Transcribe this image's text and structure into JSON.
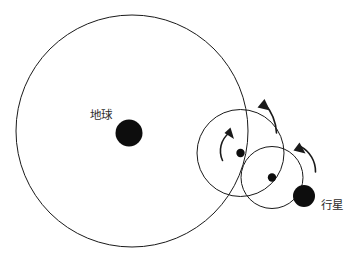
{
  "diagram": {
    "type": "ptolemaic-epicycle-diagram",
    "title": "",
    "background_color": "#ffffff",
    "stroke_color": "#1a1a1a",
    "label_color": "#2b2b2b",
    "canvas": {
      "width": 355,
      "height": 258
    },
    "labels": {
      "earth": "地球",
      "planet": "行星"
    },
    "label_positions": {
      "earth": {
        "x": 90,
        "y": 115
      },
      "planet": {
        "x": 321,
        "y": 205
      }
    },
    "circles": [
      {
        "name": "deferent",
        "cx": 132,
        "cy": 131,
        "r": 116,
        "stroke_width": 1,
        "filled": false
      },
      {
        "name": "epicycle-primary",
        "cx": 240.5,
        "cy": 153,
        "r": 43.5,
        "stroke_width": 1,
        "filled": false
      },
      {
        "name": "epicycle-secondary",
        "cx": 272,
        "cy": 177.5,
        "r": 31,
        "stroke_width": 1,
        "filled": false
      }
    ],
    "bodies": [
      {
        "name": "earth",
        "label": "地球",
        "cx": 129,
        "cy": 133,
        "r": 13.5,
        "color": "#0d0d0d"
      },
      {
        "name": "epicycle-primary-center",
        "label": "",
        "cx": 240.5,
        "cy": 153,
        "r": 4.2,
        "color": "#0d0d0d"
      },
      {
        "name": "epicycle-secondary-center",
        "label": "",
        "cx": 272,
        "cy": 177.5,
        "r": 4.2,
        "color": "#0d0d0d"
      },
      {
        "name": "planet",
        "label": "行星",
        "cx": 304,
        "cy": 196,
        "r": 11,
        "color": "#0d0d0d"
      }
    ],
    "motion_arrows": [
      {
        "name": "deferent-motion-arrow",
        "direction": "counterclockwise",
        "path": "M 274 131 A 46 46 0 0 0 262.5 102.5",
        "head": {
          "x": 262.5,
          "y": 102.5,
          "angle": -130
        }
      },
      {
        "name": "epicycle-primary-motion-arrow",
        "direction": "counterclockwise",
        "path": "M 224 160 A 22 22 0 0 1 229.5 130",
        "head": {
          "x": 229.5,
          "y": 130,
          "angle": -75
        }
      },
      {
        "name": "epicycle-secondary-motion-arrow",
        "direction": "counterclockwise",
        "path": "M 314 170 A 26 26 0 0 0 299 145",
        "head": {
          "x": 299,
          "y": 145,
          "angle": -135
        }
      }
    ]
  }
}
